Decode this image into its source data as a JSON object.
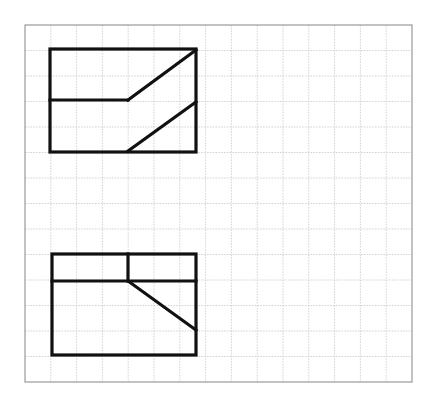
{
  "page": {
    "background_color": "#ffffff",
    "width": 428,
    "height": 397
  },
  "grid": {
    "name": "graph-paper-grid",
    "origin_x": 25,
    "origin_y": 25,
    "width": 387,
    "height": 357,
    "columns": 15,
    "rows": 14,
    "cell_width": 25.8,
    "cell_height": 25.5,
    "line_color": "#c9c9c9",
    "border_color": "#9a9a9a",
    "line_width": 0.8,
    "border_width": 1.2,
    "fill_color": "#ffffff"
  },
  "drawing": {
    "line_color": "#111111",
    "stroke_width": 3.2,
    "views": [
      {
        "id": "top-view",
        "name": "Upper orthographic view",
        "outline": {
          "x": 50,
          "y": 49,
          "width": 146,
          "height": 103,
          "label": "outer rectangle"
        },
        "segments": [
          {
            "id": "top-horizontal-divider",
            "kind": "line",
            "x1": 50,
            "y1": 100,
            "x2": 128,
            "y2": 100,
            "note": "horizontal edge from left side to diagonal start"
          },
          {
            "id": "top-upper-diagonal",
            "kind": "line",
            "x1": 128,
            "y1": 100,
            "x2": 196,
            "y2": 50,
            "note": "diagonal rising to top-right corner"
          },
          {
            "id": "top-lower-diagonal",
            "kind": "line",
            "x1": 128,
            "y1": 151,
            "x2": 196,
            "y2": 102,
            "note": "diagonal rising from bottom edge to right side"
          }
        ]
      },
      {
        "id": "front-view",
        "name": "Lower orthographic view",
        "outline": {
          "x": 52,
          "y": 254,
          "width": 144,
          "height": 101,
          "label": "outer rectangle"
        },
        "segments": [
          {
            "id": "front-horizontal-divider",
            "kind": "line",
            "x1": 52,
            "y1": 281,
            "x2": 196,
            "y2": 281,
            "note": "full-width horizontal edge near top"
          },
          {
            "id": "front-vertical-divider",
            "kind": "line",
            "x1": 128,
            "y1": 254,
            "x2": 128,
            "y2": 281,
            "note": "short vertical edge in upper band"
          },
          {
            "id": "front-descending-diagonal",
            "kind": "line",
            "x1": 128,
            "y1": 281,
            "x2": 196,
            "y2": 330,
            "note": "diagonal descending to the right side"
          }
        ]
      }
    ]
  }
}
